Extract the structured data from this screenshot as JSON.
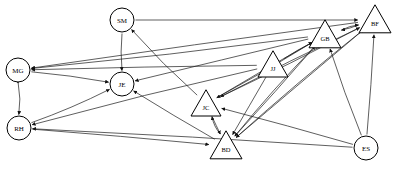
{
  "diagram": {
    "type": "directed-graph",
    "background_color": "#ffffff",
    "node_fill": "#ffffff",
    "node_stroke": "#000000",
    "edge_color": "#1a1a1a",
    "nodes": [
      {
        "id": "SM",
        "label": "SM",
        "shape": "circle",
        "x": 122,
        "y": 20,
        "r": 12
      },
      {
        "id": "MG",
        "label": "MG",
        "shape": "circle",
        "x": 18,
        "y": 70,
        "r": 12
      },
      {
        "id": "JE",
        "label": "JE",
        "shape": "circle",
        "x": 122,
        "y": 84,
        "r": 12
      },
      {
        "id": "RH",
        "label": "RH",
        "shape": "circle",
        "x": 19,
        "y": 128,
        "r": 12
      },
      {
        "id": "ES",
        "label": "ES",
        "shape": "circle",
        "x": 366,
        "y": 148,
        "r": 12
      },
      {
        "id": "JJ",
        "label": "JJ",
        "shape": "triangle",
        "x": 273,
        "y": 65,
        "r": 15
      },
      {
        "id": "GB",
        "label": "GB",
        "shape": "triangle",
        "x": 325,
        "y": 35,
        "r": 16
      },
      {
        "id": "BF",
        "label": "BF",
        "shape": "triangle",
        "x": 375,
        "y": 20,
        "r": 16
      },
      {
        "id": "JC",
        "label": "JC",
        "shape": "triangle",
        "x": 206,
        "y": 104,
        "r": 15
      },
      {
        "id": "BD",
        "label": "BD",
        "shape": "triangle",
        "x": 226,
        "y": 146,
        "r": 16
      }
    ],
    "edges": [
      {
        "from": "SM",
        "to": "BF",
        "arrow": "single"
      },
      {
        "from": "SM",
        "to": "JE",
        "arrow": "single"
      },
      {
        "from": "GB",
        "to": "MG",
        "arrow": "single"
      },
      {
        "from": "BF",
        "to": "MG",
        "arrow": "single"
      },
      {
        "from": "JJ",
        "to": "MG",
        "arrow": "single"
      },
      {
        "from": "JC",
        "to": "SM",
        "arrow": "single"
      },
      {
        "from": "GB",
        "to": "JE",
        "arrow": "single"
      },
      {
        "from": "BD",
        "to": "JE",
        "arrow": "single"
      },
      {
        "from": "MG",
        "to": "JE",
        "arrow": "single"
      },
      {
        "from": "RH",
        "to": "JE",
        "arrow": "single"
      },
      {
        "from": "MG",
        "to": "RH",
        "arrow": "double"
      },
      {
        "from": "JJ",
        "to": "RH",
        "arrow": "single"
      },
      {
        "from": "ES",
        "to": "RH",
        "arrow": "single"
      },
      {
        "from": "BD",
        "to": "GB",
        "arrow": "single"
      },
      {
        "from": "JC",
        "to": "GB",
        "arrow": "single"
      },
      {
        "from": "JJ",
        "to": "GB",
        "arrow": "single"
      },
      {
        "from": "ES",
        "to": "GB",
        "arrow": "single"
      },
      {
        "from": "BF",
        "to": "GB",
        "arrow": "single"
      },
      {
        "from": "GB",
        "to": "BF",
        "arrow": "single"
      },
      {
        "from": "BD",
        "to": "BF",
        "arrow": "single"
      },
      {
        "from": "ES",
        "to": "BF",
        "arrow": "single"
      },
      {
        "from": "JC",
        "to": "BF",
        "arrow": "single"
      },
      {
        "from": "BD",
        "to": "JC",
        "arrow": "single"
      },
      {
        "from": "GB",
        "to": "JC",
        "arrow": "single"
      },
      {
        "from": "BF",
        "to": "JC",
        "arrow": "single"
      },
      {
        "from": "ES",
        "to": "JC",
        "arrow": "single"
      },
      {
        "from": "JC",
        "to": "BD",
        "arrow": "single"
      },
      {
        "from": "GB",
        "to": "BD",
        "arrow": "single"
      },
      {
        "from": "BF",
        "to": "BD",
        "arrow": "single"
      },
      {
        "from": "RH",
        "to": "BD",
        "arrow": "single"
      },
      {
        "from": "JJ",
        "to": "BD",
        "arrow": "single"
      }
    ]
  }
}
